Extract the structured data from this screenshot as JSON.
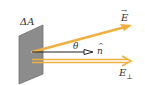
{
  "diagram": {
    "labels": {
      "area": "ΔA",
      "field": "E",
      "field_vector_mark": "→",
      "normal": "n",
      "normal_hat": "^",
      "angle": "θ",
      "perp_base": "E",
      "perp_sub": "⊥"
    },
    "colors": {
      "plate_fill": "#8c8c8c",
      "plate_stroke": "#6e6e6e",
      "field_arrow": "#f0b040",
      "normal_arrow": "#222222",
      "label": "#333333",
      "background": "#ffffff"
    },
    "elements": [
      {
        "name": "area-element-plate",
        "shape": "parallelogram"
      },
      {
        "name": "field-vector-E",
        "from": [
          32,
          52
        ],
        "to": [
          131,
          25
        ]
      },
      {
        "name": "normal-vector-n",
        "from": [
          32,
          52
        ],
        "to": [
          92,
          52
        ]
      },
      {
        "name": "perpendicular-component-E-perp",
        "from": [
          32,
          61
        ],
        "to": [
          131,
          61
        ]
      }
    ]
  }
}
